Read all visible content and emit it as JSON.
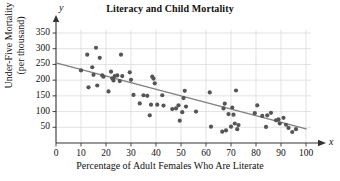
{
  "chart_data": {
    "type": "scatter",
    "title": "Literacy and Child Mortality",
    "xlabel": "Percentage of Adult Females Who Are Literate",
    "ylabel_line1": "Under-Five Mortality",
    "ylabel_line2": "(per thousand)",
    "x_axis_letter": "x",
    "y_axis_letter": "y",
    "xlim": [
      0,
      105
    ],
    "ylim": [
      0,
      370
    ],
    "xticks": [
      0,
      10,
      20,
      30,
      40,
      50,
      60,
      70,
      80,
      90,
      100
    ],
    "yticks": [
      50,
      100,
      150,
      200,
      250,
      300,
      350
    ],
    "grid": true,
    "legend": "none",
    "dot_color": "#555555",
    "line_color": "#808080",
    "grid_color": "#d6d6d6",
    "axis_color": "#333333",
    "trend_line": {
      "label": "least-squares regression line",
      "x0": 0,
      "y0": 255,
      "x1": 100,
      "y1": 45
    },
    "points": [
      [
        10,
        231
      ],
      [
        12.5,
        281
      ],
      [
        13,
        177
      ],
      [
        14.5,
        241
      ],
      [
        15,
        217
      ],
      [
        16,
        303
      ],
      [
        16.5,
        183
      ],
      [
        17.5,
        271
      ],
      [
        18.5,
        215
      ],
      [
        19,
        211
      ],
      [
        21,
        164
      ],
      [
        22,
        227
      ],
      [
        22.5,
        206
      ],
      [
        23,
        199
      ],
      [
        23.5,
        213
      ],
      [
        24.5,
        215
      ],
      [
        25.5,
        197
      ],
      [
        26,
        281
      ],
      [
        26.5,
        213
      ],
      [
        29.5,
        225
      ],
      [
        30,
        201
      ],
      [
        31,
        153
      ],
      [
        33.5,
        126
      ],
      [
        35,
        152
      ],
      [
        36.5,
        150
      ],
      [
        37.5,
        88
      ],
      [
        38,
        122
      ],
      [
        38.5,
        211
      ],
      [
        39,
        205
      ],
      [
        39.5,
        190
      ],
      [
        40.5,
        122
      ],
      [
        42.5,
        152
      ],
      [
        43,
        119
      ],
      [
        46.5,
        108
      ],
      [
        48,
        110
      ],
      [
        49,
        120
      ],
      [
        49.5,
        71
      ],
      [
        50.5,
        98
      ],
      [
        51,
        143
      ],
      [
        51.5,
        166
      ],
      [
        52,
        116
      ],
      [
        56,
        100
      ],
      [
        61.5,
        161
      ],
      [
        62,
        52
      ],
      [
        66.5,
        36
      ],
      [
        67,
        110
      ],
      [
        67.5,
        125
      ],
      [
        68,
        40
      ],
      [
        69,
        92
      ],
      [
        70,
        52
      ],
      [
        70.5,
        113
      ],
      [
        71,
        90
      ],
      [
        71.5,
        62
      ],
      [
        72,
        167
      ],
      [
        72.5,
        44
      ],
      [
        73,
        57
      ],
      [
        79.5,
        95
      ],
      [
        80.5,
        120
      ],
      [
        82.5,
        86
      ],
      [
        84,
        51
      ],
      [
        84.5,
        88
      ],
      [
        86,
        96
      ],
      [
        88,
        72
      ],
      [
        89,
        75
      ],
      [
        89.5,
        62
      ],
      [
        91,
        80
      ],
      [
        92,
        58
      ],
      [
        93,
        48
      ],
      [
        94.5,
        35
      ],
      [
        96,
        44
      ]
    ]
  }
}
